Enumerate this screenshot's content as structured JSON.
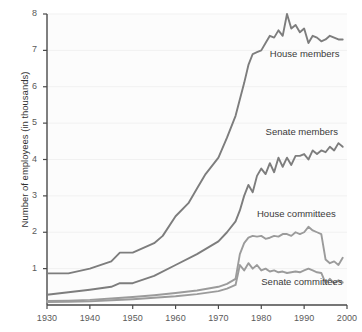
{
  "chart_data": {
    "type": "line",
    "title": "",
    "subtitle": "",
    "xlabel": "",
    "ylabel": "Number of employees (in thousands)",
    "xlim": [
      1930,
      2000
    ],
    "ylim": [
      0,
      8
    ],
    "xticks": [
      1930,
      1940,
      1950,
      1960,
      1970,
      1980,
      1990,
      2000
    ],
    "yticks": [
      1,
      2,
      3,
      4,
      5,
      6,
      7,
      8
    ],
    "xtick_labels": [
      "1930",
      "1940",
      "1950",
      "1960",
      "1970",
      "1980",
      "1990",
      "2000"
    ],
    "ytick_labels": [
      "1",
      "2",
      "3",
      "4",
      "5",
      "6",
      "7",
      "8"
    ],
    "grid": "horizontal-faint",
    "legend": "inline-annotations",
    "line_color": "#808080",
    "series": [
      {
        "name": "House members",
        "label": "House members",
        "color": "#7d7d7d",
        "x": [
          1930,
          1935,
          1940,
          1945,
          1947,
          1950,
          1955,
          1957,
          1960,
          1963,
          1965,
          1967,
          1970,
          1972,
          1974,
          1976,
          1977,
          1978,
          1979,
          1980,
          1981,
          1982,
          1983,
          1984,
          1985,
          1986,
          1987,
          1988,
          1989,
          1990,
          1991,
          1992,
          1993,
          1994,
          1995,
          1996,
          1997,
          1998,
          1999
        ],
        "values": [
          0.87,
          0.87,
          1.0,
          1.2,
          1.44,
          1.44,
          1.7,
          1.9,
          2.44,
          2.8,
          3.2,
          3.6,
          4.05,
          4.6,
          5.2,
          6.1,
          6.6,
          6.9,
          6.95,
          7.0,
          7.2,
          7.4,
          7.35,
          7.55,
          7.4,
          8.0,
          7.6,
          7.7,
          7.5,
          7.6,
          7.2,
          7.4,
          7.35,
          7.25,
          7.3,
          7.4,
          7.35,
          7.3,
          7.3
        ]
      },
      {
        "name": "Senate members",
        "label": "Senate members",
        "color": "#7d7d7d",
        "x": [
          1930,
          1935,
          1940,
          1945,
          1947,
          1950,
          1955,
          1960,
          1965,
          1970,
          1972,
          1974,
          1975,
          1976,
          1977,
          1978,
          1979,
          1980,
          1981,
          1982,
          1983,
          1984,
          1985,
          1986,
          1987,
          1988,
          1989,
          1990,
          1991,
          1992,
          1993,
          1994,
          1995,
          1996,
          1997,
          1998,
          1999
        ],
        "values": [
          0.28,
          0.35,
          0.42,
          0.5,
          0.6,
          0.6,
          0.8,
          1.1,
          1.4,
          1.75,
          2.0,
          2.3,
          2.6,
          3.0,
          3.3,
          3.1,
          3.55,
          3.75,
          3.6,
          3.9,
          3.65,
          4.05,
          3.8,
          4.05,
          3.85,
          4.1,
          4.1,
          4.15,
          4.0,
          4.25,
          4.15,
          4.25,
          4.2,
          4.35,
          4.25,
          4.45,
          4.35
        ]
      },
      {
        "name": "House committees",
        "label": "House committees",
        "color": "#9b9b9b",
        "x": [
          1930,
          1935,
          1940,
          1945,
          1950,
          1955,
          1960,
          1965,
          1970,
          1972,
          1974,
          1975,
          1976,
          1977,
          1978,
          1979,
          1980,
          1981,
          1982,
          1983,
          1984,
          1985,
          1986,
          1987,
          1988,
          1989,
          1990,
          1991,
          1992,
          1993,
          1994,
          1995,
          1996,
          1997,
          1998,
          1999
        ],
        "values": [
          0.11,
          0.12,
          0.14,
          0.18,
          0.22,
          0.27,
          0.33,
          0.4,
          0.5,
          0.58,
          0.72,
          1.4,
          1.7,
          1.85,
          1.9,
          1.88,
          1.9,
          1.82,
          1.85,
          1.9,
          1.88,
          1.95,
          1.95,
          1.9,
          2.0,
          1.95,
          2.0,
          2.15,
          2.05,
          2.0,
          1.95,
          1.25,
          1.15,
          1.2,
          1.1,
          1.3
        ]
      },
      {
        "name": "Senate committees",
        "label": "Senate committees",
        "color": "#9b9b9b",
        "x": [
          1930,
          1935,
          1940,
          1945,
          1950,
          1955,
          1960,
          1965,
          1970,
          1972,
          1974,
          1975,
          1976,
          1977,
          1978,
          1979,
          1980,
          1981,
          1982,
          1983,
          1984,
          1985,
          1986,
          1987,
          1988,
          1989,
          1990,
          1991,
          1992,
          1993,
          1994,
          1995,
          1996,
          1997,
          1998,
          1999
        ],
        "values": [
          0.08,
          0.09,
          0.1,
          0.13,
          0.16,
          0.2,
          0.24,
          0.3,
          0.38,
          0.45,
          0.55,
          1.1,
          0.95,
          1.15,
          1.0,
          1.1,
          0.95,
          1.0,
          0.92,
          0.95,
          0.9,
          0.92,
          0.88,
          0.9,
          0.92,
          0.9,
          0.95,
          1.0,
          0.95,
          0.9,
          0.88,
          0.6,
          0.72,
          0.6,
          0.68,
          0.62
        ]
      }
    ],
    "annotations": [
      {
        "text": "House members",
        "x": 1982,
        "y": 6.9
      },
      {
        "text": "Senate members",
        "x": 1981,
        "y": 4.75
      },
      {
        "text": "House committees",
        "x": 1979,
        "y": 2.5
      },
      {
        "text": "Senate committees",
        "x": 1980,
        "y": 0.62
      }
    ]
  },
  "axes": {
    "y_axis_title": "Number of employees (in thousands)"
  }
}
